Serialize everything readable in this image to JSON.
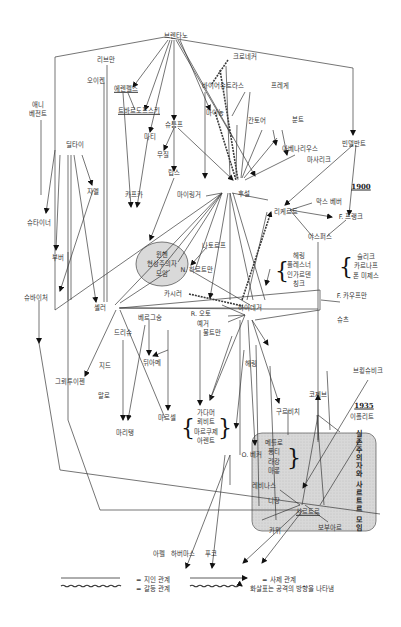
{
  "nodes": {
    "brentano": "브렌타노",
    "liebmann": "리브만",
    "eucken": "오이켄",
    "ehrenfels": "에렌펠스",
    "anna_bezant": "애니\n베전트",
    "twardowski": "트바르도프스키",
    "meinong": "마이농",
    "stumpf": "슈툼프",
    "marty": "마티",
    "kafka": "카프카",
    "musil": "무질",
    "lipps": "립스",
    "dilthey": "딜타이",
    "simmel": "지멜",
    "steiner": "슈타이너",
    "buber": "부버",
    "schweitzer": "슈바이처",
    "kroner": "크로네커",
    "weierstrass": "바이어슈트라스",
    "frege": "프레게",
    "cantor": "칸토어",
    "wundt": "분트",
    "avenarius": "아베나리우스",
    "masaryk": "마사리크",
    "windelband": "빈델반트",
    "husserl": "후설",
    "max_weber": "막스 베버",
    "rickert": "리케르트",
    "f_frank": "F. 프랭크",
    "jaspers": "야스퍼스",
    "munich_group": "뮌헨\n현상주의자\n모임",
    "mainlinger": "마이링거",
    "natorp": "나토르프",
    "n_hartmann": "N. 하르트만",
    "cassirer": "카시러",
    "heidegger": "하이데거",
    "r_otto": "R. 오토",
    "jaeger": "예거",
    "bultmann": "불트만",
    "herring_group": "헤링\n플레스너\n인가르덴\n칭크",
    "scheler_group": "슐리크\n카르나프\n폰 미제스",
    "f_kaufmann": "F. 카우프만",
    "schutz": "슈츠",
    "scheler": "셸러",
    "bergson": "베르그송",
    "driesch": "드리슈",
    "gurvitch_top": "뒤아메",
    "groethuysen": "그뢰투이젠",
    "gide": "지드",
    "malraux": "말로",
    "marcel": "마르셀",
    "maritain": "마리탱",
    "gadamer_group": "가다머\n뢰비트\n마르쿠제\n아렌트",
    "loewith": "뢰비트",
    "o_becker": "O. 베커",
    "hering": "헤링",
    "gurwitsch": "구르비치",
    "koyre": "코제브",
    "brunschvicg": "브룅슈비크",
    "hyppolite": "이폴리트",
    "merleau_group": "메를로\n퐁티\n라캉\n마롱",
    "levinas": "레비나스",
    "nizan": "니장",
    "sartre": "사르트르",
    "beauvoir": "보부아르",
    "camus": "카뮈",
    "apel": "아펠",
    "habermas": "하버마스",
    "eco": "푸코",
    "existential_group": "실존주의자와\n사르트르 모임"
  },
  "years": [
    "1900",
    "1935"
  ],
  "legend": {
    "personal_relation": "= 지인 관계",
    "conflict_relation": "= 갈등 관계",
    "teacher_relation": "= 사제 관계",
    "attack_direction": "화살표는 공격의 방향을 나타냄"
  },
  "colors": {
    "line": "#3a3a3a",
    "ellipse_fill": "#d9d9d9",
    "group_box_fill": "#d4d4d4"
  }
}
